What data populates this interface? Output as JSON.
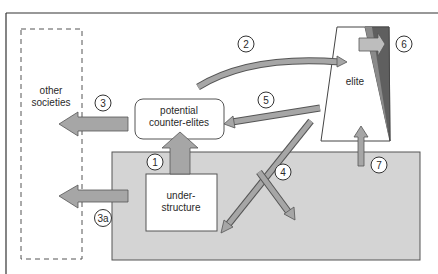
{
  "labels": {
    "other_societies_line1": "other",
    "other_societies_line2": "societies",
    "counter_elites_line1": "potential",
    "counter_elites_line2": "counter-elites",
    "elite": "elite",
    "understructure_line1": "under-",
    "understructure_line2": "structure"
  },
  "markers": {
    "m1": "1",
    "m2": "2",
    "m3": "3",
    "m3a": "3a",
    "m4": "4",
    "m5": "5",
    "m6": "6",
    "m7": "7"
  },
  "colors": {
    "frame": "#333333",
    "society_fill": "#d4d4d4",
    "arrow_fill": "#a6a6a6",
    "arrow_fill_light": "#bdbdbd",
    "elite_dark": "#5f5f5f",
    "stroke": "#444444"
  }
}
